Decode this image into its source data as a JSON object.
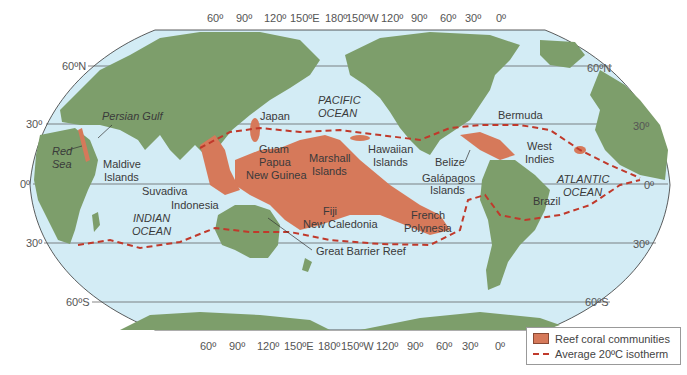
{
  "map": {
    "title": "",
    "colors": {
      "ocean": "#d3ecf5",
      "land": "#7d9e6b",
      "reef": "#d6795a",
      "isotherm": "#c0392b"
    },
    "longitude_labels_top": [
      "60º",
      "90º",
      "120º",
      "150ºE",
      "180º",
      "150ºW",
      "120º",
      "90º",
      "60º",
      "30º",
      "0º"
    ],
    "longitude_labels_bottom": [
      "60º",
      "90º",
      "120º",
      "150ºE",
      "180º",
      "150ºW",
      "120º",
      "90º",
      "60º",
      "30º",
      "0º"
    ],
    "latitude_labels_left": [
      "60ºN",
      "30º",
      "0º",
      "30º",
      "60ºS"
    ],
    "latitude_labels_right": [
      "60ºN",
      "30º",
      "0º",
      "30º",
      "60ºS"
    ],
    "place_labels": {
      "persian_gulf": "Persian Gulf",
      "red_sea_1": "Red",
      "red_sea_2": "Sea",
      "maldive_1": "Maldive",
      "maldive_2": "Islands",
      "suvadiva": "Suvadiva",
      "indonesia": "Indonesia",
      "indian_ocean_1": "INDIAN",
      "indian_ocean_2": "OCEAN",
      "japan": "Japan",
      "pacific_ocean_1": "PACIFIC",
      "pacific_ocean_2": "OCEAN",
      "guam": "Guam",
      "papua_1": "Papua",
      "papua_2": "New Guinea",
      "marshall_1": "Marshall",
      "marshall_2": "Islands",
      "hawaiian_1": "Hawaiian",
      "hawaiian_2": "Islands",
      "fiji": "Fiji",
      "new_caledonia": "New Caledonia",
      "great_barrier_reef": "Great Barrier Reef",
      "french_polynesia_1": "French",
      "french_polynesia_2": "Polynesia",
      "belize": "Belize",
      "galapagos_1": "Galápagos",
      "galapagos_2": "Islands",
      "bermuda": "Bermuda",
      "west_indies_1": "West",
      "west_indies_2": "Indies",
      "atlantic_ocean_1": "ATLANTIC",
      "atlantic_ocean_2": "OCEAN",
      "brazil": "Brazil"
    }
  },
  "legend": {
    "items": [
      {
        "label": "Reef coral communities",
        "symbol": "filled-swatch"
      },
      {
        "label": "Average 20ºC isotherm",
        "symbol": "dashed-line"
      }
    ]
  }
}
